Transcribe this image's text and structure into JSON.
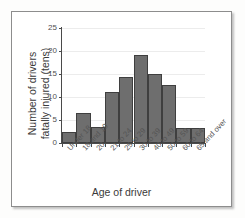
{
  "chart_data": {
    "type": "bar",
    "title": "",
    "xlabel": "Age of driver",
    "ylabel_line1": "Number of drivers",
    "ylabel_line2": "fatally injured (tens)",
    "ylabel": "Number of drivers fatally injured (tens)",
    "categories": [
      "Under 18",
      "18 and 19",
      "20",
      "21 to 24",
      "25 to 29",
      "30 to 39",
      "40 to 49",
      "50 to 59",
      "60 to 64",
      "65 and over"
    ],
    "values": [
      2.5,
      6.5,
      3.4,
      11.1,
      14.4,
      19.2,
      15.0,
      12.7,
      3.3,
      3.3
    ],
    "ylim": [
      0,
      25
    ],
    "yticks": [
      0,
      5,
      10,
      15,
      20,
      25
    ],
    "ytick_labels": [
      "0",
      "5",
      "10",
      "15",
      "20",
      "25"
    ],
    "grid": true,
    "legend": false,
    "legend_position": "none",
    "bar_color": "#6e6e6e",
    "bar_edge_color": "#3f3f3f",
    "grid_color": "#ececec",
    "axis_color": "#4a4a4a",
    "frame_border_color": "#8d8d8d",
    "background_color": "#ffffff"
  }
}
